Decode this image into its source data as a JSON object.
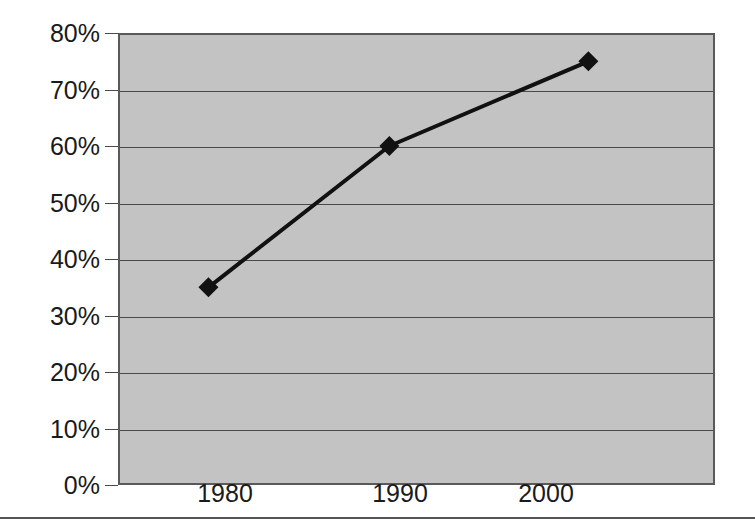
{
  "chart_data": {
    "type": "line",
    "title": "",
    "subtitle": "",
    "xlabel": "",
    "ylabel": "",
    "x": [
      1980,
      1990,
      2001
    ],
    "categories": [
      "1980",
      "1990",
      "2000"
    ],
    "values": [
      35,
      60,
      75
    ],
    "series": [
      {
        "name": "",
        "x": [
          1980,
          1990,
          2001
        ],
        "values": [
          35,
          60,
          75
        ]
      }
    ],
    "xlim": [
      1975,
      2008
    ],
    "ylim": [
      0,
      80
    ],
    "y_tick_labels": [
      "80%",
      "70%",
      "60%",
      "50%",
      "40%",
      "30%",
      "20%",
      "10%",
      "0%"
    ],
    "y_tick_values": [
      80,
      70,
      60,
      50,
      40,
      30,
      20,
      10,
      0
    ],
    "x_tick_labels": [
      "1980",
      "1990",
      "2000"
    ],
    "x_tick_values": [
      1980,
      1990,
      2000
    ],
    "grid": true,
    "legend": false,
    "legend_position": "none",
    "marker": "diamond",
    "annotations": [],
    "colors": {
      "plot_background": "#c3c3c3",
      "page_background": "#ffffff",
      "line": "#111111",
      "marker": "#111111",
      "gridline": "#4a4a4a",
      "frame": "#595959",
      "text": "#1a1a1a",
      "rule": "#555555"
    }
  },
  "axis": {
    "y_labels": [
      {
        "text": "80%",
        "top": 35
      },
      {
        "text": "70%",
        "top": 91
      },
      {
        "text": "60%",
        "top": 147
      },
      {
        "text": "50%",
        "top": 203
      },
      {
        "text": "40%",
        "top": 260
      },
      {
        "text": "30%",
        "top": 316
      },
      {
        "text": "20%",
        "top": 372
      },
      {
        "text": "10%",
        "top": 428
      },
      {
        "text": "0%",
        "top": 484
      }
    ],
    "x_labels": [
      {
        "text": "1980",
        "left": 225
      },
      {
        "text": "1990",
        "left": 400
      },
      {
        "text": "2000",
        "left": 546
      }
    ]
  }
}
